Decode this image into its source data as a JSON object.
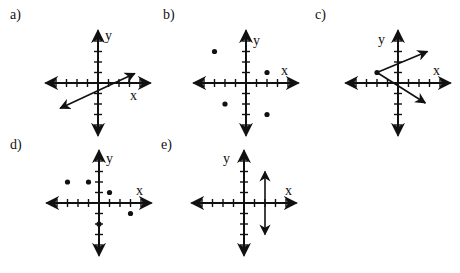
{
  "figure": {
    "tick_spacing_px": 10.5,
    "axis_half_length_units": 5,
    "colors": {
      "ink": "#111111",
      "background": "#ffffff"
    }
  },
  "panels": [
    {
      "id": "a",
      "label": "a)",
      "label_pos": [
        10,
        20
      ],
      "origin": [
        98,
        83
      ],
      "x_label": "x",
      "x_label_pos": [
        130,
        100
      ],
      "y_label": "y",
      "y_label_pos": [
        105,
        40
      ],
      "points": [],
      "segments": [
        {
          "from": [
            -3.6,
            -2.4
          ],
          "to": [
            3.5,
            0.9
          ],
          "arrow_start": true,
          "arrow_end": true
        }
      ],
      "content": "Straight line with slope 1/2, y-intercept -1, arrows on both ends"
    },
    {
      "id": "b",
      "label": "b)",
      "label_pos": [
        163,
        20
      ],
      "origin": [
        246,
        83
      ],
      "x_label": "x",
      "x_label_pos": [
        281,
        75
      ],
      "y_label": "y",
      "y_label_pos": [
        253,
        45
      ],
      "points": [
        [
          -3,
          3
        ],
        [
          2,
          1
        ],
        [
          -2,
          -2
        ],
        [
          2,
          -3
        ]
      ],
      "segments": [],
      "content": "Scatter of four discrete points"
    },
    {
      "id": "c",
      "label": "c)",
      "label_pos": [
        315,
        20
      ],
      "origin": [
        398,
        83
      ],
      "x_label": "x",
      "x_label_pos": [
        433,
        75
      ],
      "y_label": "y",
      "y_label_pos": [
        378,
        44
      ],
      "points": [
        [
          -2,
          1
        ]
      ],
      "segments": [
        {
          "from": [
            -2,
            1
          ],
          "to": [
            2.8,
            3.0
          ],
          "arrow_start": false,
          "arrow_end": true
        },
        {
          "from": [
            -2,
            1
          ],
          "to": [
            2.6,
            -1.9
          ],
          "arrow_start": false,
          "arrow_end": true
        }
      ],
      "content": "Sideways V: two rays from vertex (-2,1)"
    },
    {
      "id": "d",
      "label": "d)",
      "label_pos": [
        10,
        150
      ],
      "origin": [
        99,
        203
      ],
      "x_label": "x",
      "x_label_pos": [
        136,
        195
      ],
      "y_label": "y",
      "y_label_pos": [
        106,
        163
      ],
      "points": [
        [
          -3,
          2
        ],
        [
          -1,
          2
        ],
        [
          1,
          1
        ],
        [
          3,
          -1
        ],
        [
          0,
          -2
        ]
      ],
      "segments": [],
      "content": "Scatter of five discrete points"
    },
    {
      "id": "e",
      "label": "e)",
      "label_pos": [
        161,
        150
      ],
      "origin": [
        244,
        203
      ],
      "x_label": "x",
      "x_label_pos": [
        285,
        195
      ],
      "y_label": "y",
      "y_label_pos": [
        223,
        163
      ],
      "points": [],
      "segments": [
        {
          "from": [
            2,
            3
          ],
          "to": [
            2,
            -3
          ],
          "arrow_start": true,
          "arrow_end": true
        }
      ],
      "content": "Vertical line x = 2 with arrows on both ends"
    }
  ]
}
